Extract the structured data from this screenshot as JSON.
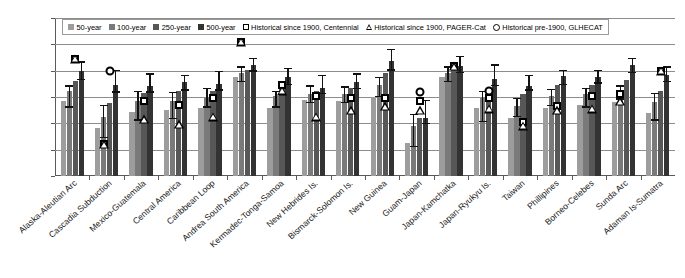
{
  "chart_data": {
    "type": "bar",
    "title": "",
    "xlabel": "",
    "ylabel": "",
    "ylim": [
      7,
      10
    ],
    "ytick_values": [
      7,
      7.5,
      8,
      8.5,
      9,
      9.5,
      10
    ],
    "ytick_labels": [
      "7",
      "7.5",
      "8",
      "8.5",
      "9",
      "9.5",
      "10"
    ],
    "grid": true,
    "legend_position": "top-inside",
    "categories": [
      "Alaska-Aleutian Arc",
      "Cascadia Subduction",
      "Mexico-Guatemala",
      "Central America",
      "Caribbean Loop",
      "Andrea South America",
      "Kermadec-Tonga-Samoa",
      "New Hebrides Is.",
      "Bismarck-Solomon Is.",
      "New Guinea",
      "Guam-Japan",
      "Japan-Kamchatka",
      "Japan-Ryukyu Is.",
      "Taiwan",
      "Phillipines",
      "Borneo-Celebes",
      "Sunda Arc",
      "Adaman Is-Sumatra"
    ],
    "series": [
      {
        "name": "50-year",
        "color": "#9d9d9d",
        "values": [
          8.42,
          7.92,
          8.22,
          8.25,
          8.3,
          8.88,
          8.3,
          8.45,
          8.42,
          8.5,
          7.62,
          8.88,
          8.3,
          8.1,
          8.3,
          8.35,
          8.4,
          8.2
        ]
      },
      {
        "name": "100-year",
        "color": "#7a7a7a",
        "values": [
          8.62,
          8.12,
          8.42,
          8.42,
          8.48,
          8.95,
          8.52,
          8.55,
          8.55,
          8.72,
          7.95,
          8.95,
          8.48,
          8.32,
          8.52,
          8.55,
          8.62,
          8.4
        ]
      },
      {
        "name": "250-year",
        "color": "#575757",
        "values": [
          8.8,
          8.38,
          8.58,
          8.62,
          8.62,
          9.02,
          8.72,
          8.62,
          8.68,
          8.95,
          8.1,
          9.02,
          8.68,
          8.55,
          8.72,
          8.72,
          8.82,
          8.62
        ]
      },
      {
        "name": "500-year",
        "color": "#333333",
        "values": [
          9.0,
          8.72,
          8.7,
          8.78,
          8.75,
          9.1,
          8.88,
          8.68,
          8.78,
          9.18,
          8.1,
          9.08,
          8.85,
          8.7,
          8.9,
          8.88,
          9.1,
          8.92
        ]
      }
    ],
    "error_bars": {
      "description": "Vertical whiskers with caps centred on the 100-year and 500-year bars of each group",
      "groups": [
        {
          "category": "Alaska-Aleutian Arc",
          "bars": [
            {
              "index": 1,
              "low": 8.3,
              "high": 8.72
            },
            {
              "index": 3,
              "low": 8.82,
              "high": 9.18
            }
          ]
        },
        {
          "category": "Cascadia Subduction",
          "bars": [
            {
              "index": 1,
              "low": 7.72,
              "high": 8.35
            },
            {
              "index": 3,
              "low": 8.58,
              "high": 9.02
            }
          ]
        },
        {
          "category": "Mexico-Guatemala",
          "bars": [
            {
              "index": 1,
              "low": 8.05,
              "high": 8.62
            },
            {
              "index": 3,
              "low": 8.58,
              "high": 8.95
            }
          ]
        },
        {
          "category": "Central America",
          "bars": [
            {
              "index": 1,
              "low": 8.08,
              "high": 8.6
            },
            {
              "index": 3,
              "low": 8.62,
              "high": 8.92
            }
          ]
        },
        {
          "category": "Caribbean Loop",
          "bars": [
            {
              "index": 1,
              "low": 8.3,
              "high": 8.68
            },
            {
              "index": 3,
              "low": 8.62,
              "high": 9.0
            }
          ]
        },
        {
          "category": "Andrea South America",
          "bars": [
            {
              "index": 1,
              "low": 8.78,
              "high": 9.08
            },
            {
              "index": 3,
              "low": 8.98,
              "high": 9.25
            }
          ]
        },
        {
          "category": "Kermadec-Tonga-Samoa",
          "bars": [
            {
              "index": 1,
              "low": 8.3,
              "high": 8.62
            },
            {
              "index": 3,
              "low": 8.72,
              "high": 9.05
            }
          ]
        },
        {
          "category": "New Hebrides Is.",
          "bars": [
            {
              "index": 1,
              "low": 8.38,
              "high": 8.72
            },
            {
              "index": 3,
              "low": 8.55,
              "high": 8.92
            }
          ]
        },
        {
          "category": "Bismarck-Solomon Is.",
          "bars": [
            {
              "index": 1,
              "low": 8.38,
              "high": 8.7
            },
            {
              "index": 3,
              "low": 8.65,
              "high": 8.95
            }
          ]
        },
        {
          "category": "New Guinea",
          "bars": [
            {
              "index": 1,
              "low": 8.5,
              "high": 8.88
            },
            {
              "index": 3,
              "low": 9.0,
              "high": 9.42
            }
          ]
        },
        {
          "category": "Guam-Japan",
          "bars": [
            {
              "index": 1,
              "low": 7.55,
              "high": 8.18
            },
            {
              "index": 3,
              "low": 7.98,
              "high": 8.45
            }
          ]
        },
        {
          "category": "Japan-Kamchatka",
          "bars": [
            {
              "index": 1,
              "low": 8.78,
              "high": 9.08
            },
            {
              "index": 3,
              "low": 8.95,
              "high": 9.28
            }
          ]
        },
        {
          "category": "Japan-Ryukyu Is.",
          "bars": [
            {
              "index": 1,
              "low": 8.02,
              "high": 8.62
            },
            {
              "index": 3,
              "low": 8.7,
              "high": 9.12
            }
          ]
        },
        {
          "category": "Taiwan",
          "bars": [
            {
              "index": 1,
              "low": 8.12,
              "high": 8.48
            },
            {
              "index": 3,
              "low": 8.62,
              "high": 8.92
            }
          ]
        },
        {
          "category": "Phillipines",
          "bars": [
            {
              "index": 1,
              "low": 8.32,
              "high": 8.65
            },
            {
              "index": 3,
              "low": 8.72,
              "high": 9.02
            }
          ]
        },
        {
          "category": "Borneo-Celebes",
          "bars": [
            {
              "index": 1,
              "low": 8.3,
              "high": 8.68
            },
            {
              "index": 3,
              "low": 8.75,
              "high": 9.02
            }
          ]
        },
        {
          "category": "Sunda Arc",
          "bars": [
            {
              "index": 1,
              "low": 8.45,
              "high": 8.72
            },
            {
              "index": 3,
              "low": 8.95,
              "high": 9.25
            }
          ]
        },
        {
          "category": "Adaman Is-Sumatra",
          "bars": [
            {
              "index": 1,
              "low": 8.05,
              "high": 8.58
            },
            {
              "index": 3,
              "low": 8.78,
              "high": 9.08
            }
          ]
        }
      ]
    },
    "markers": {
      "description": "Historical catalogue magnitudes overplotted on each group",
      "points": [
        {
          "category": "Alaska-Aleutian Arc",
          "series": "Historical since 1900, Centennial",
          "shape": "square",
          "bar_index": 2,
          "value": 9.22
        },
        {
          "category": "Alaska-Aleutian Arc",
          "series": "Historical since 1900, PAGER-Cat",
          "shape": "triangle",
          "bar_index": 2,
          "value": 9.22
        },
        {
          "category": "Cascadia Subduction",
          "series": "Historical pre-1900, GLHECAT",
          "shape": "circle",
          "bar_index": 2,
          "value": 9.0
        },
        {
          "category": "Cascadia Subduction",
          "series": "Historical since 1900, Centennial",
          "shape": "square",
          "bar_index": 1,
          "value": 7.6
        },
        {
          "category": "Cascadia Subduction",
          "series": "Historical since 1900, PAGER-Cat",
          "shape": "triangle",
          "bar_index": 1,
          "value": 7.6
        },
        {
          "category": "Mexico-Guatemala",
          "series": "Historical since 1900, Centennial",
          "shape": "square",
          "bar_index": 2,
          "value": 8.42
        },
        {
          "category": "Mexico-Guatemala",
          "series": "Historical since 1900, PAGER-Cat",
          "shape": "triangle",
          "bar_index": 2,
          "value": 8.08
        },
        {
          "category": "Central America",
          "series": "Historical since 1900, Centennial",
          "shape": "square",
          "bar_index": 2,
          "value": 8.35
        },
        {
          "category": "Central America",
          "series": "Historical since 1900, PAGER-Cat",
          "shape": "triangle",
          "bar_index": 2,
          "value": 7.98
        },
        {
          "category": "Caribbean Loop",
          "series": "Historical since 1900, Centennial",
          "shape": "square",
          "bar_index": 2,
          "value": 8.48
        },
        {
          "category": "Caribbean Loop",
          "series": "Historical since 1900, PAGER-Cat",
          "shape": "triangle",
          "bar_index": 2,
          "value": 8.12
        },
        {
          "category": "Andrea South America",
          "series": "Historical since 1900, Centennial",
          "shape": "square",
          "bar_index": 1,
          "value": 9.55
        },
        {
          "category": "Andrea South America",
          "series": "Historical since 1900, PAGER-Cat",
          "shape": "triangle",
          "bar_index": 1,
          "value": 9.55
        },
        {
          "category": "Kermadec-Tonga-Samoa",
          "series": "Historical since 1900, Centennial",
          "shape": "square",
          "bar_index": 2,
          "value": 8.72
        },
        {
          "category": "Kermadec-Tonga-Samoa",
          "series": "Historical since 1900, PAGER-Cat",
          "shape": "triangle",
          "bar_index": 2,
          "value": 8.62
        },
        {
          "category": "New Hebrides Is.",
          "series": "Historical since 1900, Centennial",
          "shape": "square",
          "bar_index": 2,
          "value": 8.52
        },
        {
          "category": "New Hebrides Is.",
          "series": "Historical since 1900, PAGER-Cat",
          "shape": "triangle",
          "bar_index": 2,
          "value": 8.12
        },
        {
          "category": "Bismarck-Solomon Is.",
          "series": "Historical since 1900, Centennial",
          "shape": "square",
          "bar_index": 2,
          "value": 8.48
        },
        {
          "category": "Bismarck-Solomon Is.",
          "series": "Historical since 1900, PAGER-Cat",
          "shape": "triangle",
          "bar_index": 2,
          "value": 8.25
        },
        {
          "category": "New Guinea",
          "series": "Historical since 1900, Centennial",
          "shape": "square",
          "bar_index": 2,
          "value": 8.48
        },
        {
          "category": "New Guinea",
          "series": "Historical since 1900, PAGER-Cat",
          "shape": "triangle",
          "bar_index": 2,
          "value": 8.32
        },
        {
          "category": "Guam-Japan",
          "series": "Historical pre-1900, GLHECAT",
          "shape": "circle",
          "bar_index": 2,
          "value": 8.6
        },
        {
          "category": "Guam-Japan",
          "series": "Historical since 1900, Centennial",
          "shape": "square",
          "bar_index": 2,
          "value": 8.42
        },
        {
          "category": "Guam-Japan",
          "series": "Historical since 1900, PAGER-Cat",
          "shape": "triangle",
          "bar_index": 2,
          "value": 8.25
        },
        {
          "category": "Japan-Kamchatka",
          "series": "Historical since 1900, Centennial",
          "shape": "square",
          "bar_index": 2,
          "value": 9.08
        },
        {
          "category": "Japan-Kamchatka",
          "series": "Historical since 1900, PAGER-Cat",
          "shape": "triangle",
          "bar_index": 2,
          "value": 9.08
        },
        {
          "category": "Japan-Ryukyu Is.",
          "series": "Historical pre-1900, GLHECAT",
          "shape": "circle",
          "bar_index": 2,
          "value": 8.62
        },
        {
          "category": "Japan-Ryukyu Is.",
          "series": "Historical since 1900, Centennial",
          "shape": "square",
          "bar_index": 2,
          "value": 8.48
        },
        {
          "category": "Japan-Ryukyu Is.",
          "series": "Historical since 1900, PAGER-Cat",
          "shape": "triangle",
          "bar_index": 2,
          "value": 8.28
        },
        {
          "category": "Taiwan",
          "series": "Historical since 1900, Centennial",
          "shape": "square",
          "bar_index": 2,
          "value": 8.02
        },
        {
          "category": "Taiwan",
          "series": "Historical since 1900, PAGER-Cat",
          "shape": "triangle",
          "bar_index": 2,
          "value": 7.95
        },
        {
          "category": "Phillipines",
          "series": "Historical since 1900, Centennial",
          "shape": "square",
          "bar_index": 2,
          "value": 8.32
        },
        {
          "category": "Phillipines",
          "series": "Historical since 1900, PAGER-Cat",
          "shape": "triangle",
          "bar_index": 2,
          "value": 8.25
        },
        {
          "category": "Borneo-Celebes",
          "series": "Historical since 1900, Centennial",
          "shape": "square",
          "bar_index": 2,
          "value": 8.52
        },
        {
          "category": "Borneo-Celebes",
          "series": "Historical since 1900, PAGER-Cat",
          "shape": "triangle",
          "bar_index": 2,
          "value": 8.28
        },
        {
          "category": "Sunda Arc",
          "series": "Historical since 1900, Centennial",
          "shape": "square",
          "bar_index": 1,
          "value": 8.55
        },
        {
          "category": "Sunda Arc",
          "series": "Historical since 1900, PAGER-Cat",
          "shape": "triangle",
          "bar_index": 1,
          "value": 8.42
        },
        {
          "category": "Adaman Is-Sumatra",
          "series": "Historical since 1900, Centennial",
          "shape": "square",
          "bar_index": 2,
          "value": 9.0
        },
        {
          "category": "Adaman Is-Sumatra",
          "series": "Historical since 1900, PAGER-Cat",
          "shape": "triangle",
          "bar_index": 2,
          "value": 9.0
        }
      ]
    },
    "legend": [
      {
        "label": "50-year",
        "shape": "swatch",
        "color": "#9d9d9d"
      },
      {
        "label": "100-year",
        "shape": "swatch",
        "color": "#7a7a7a"
      },
      {
        "label": "250-year",
        "shape": "swatch",
        "color": "#575757"
      },
      {
        "label": "500-year",
        "shape": "swatch",
        "color": "#333333"
      },
      {
        "label": "Historical since 1900, Centennial",
        "shape": "square",
        "color": "#000000"
      },
      {
        "label": "Historical since 1900, PAGER-Cat",
        "shape": "triangle",
        "color": "#000000"
      },
      {
        "label": "Historical pre-1900, GLHECAT",
        "shape": "circle",
        "color": "#000000"
      }
    ]
  }
}
